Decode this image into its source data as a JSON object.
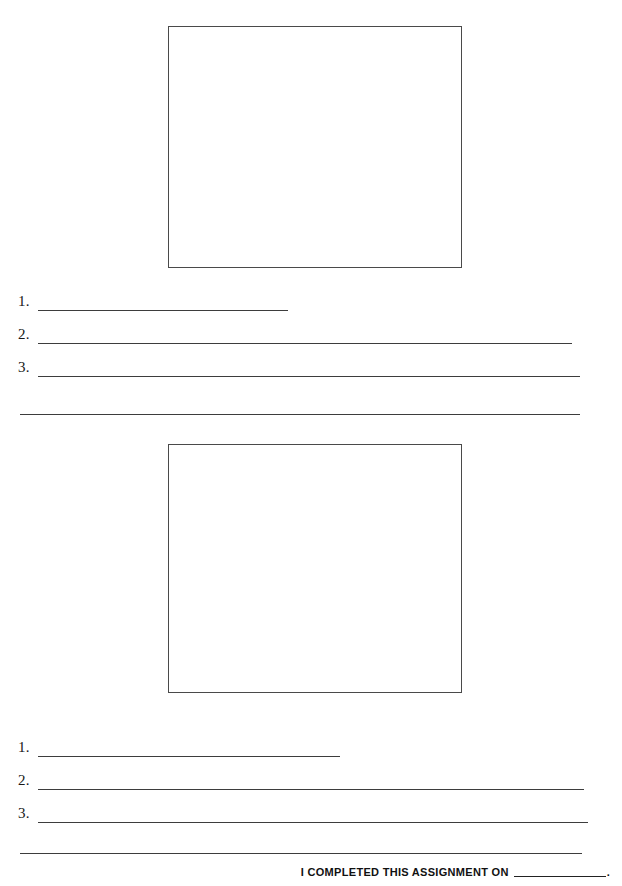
{
  "document": {
    "type": "worksheet",
    "background_color": "#ffffff",
    "ink_color": "#3d3d3d"
  },
  "sections": [
    {
      "id": "section-1",
      "draw_box": {
        "name": "drawing-area-1",
        "border_color": "#4a4a4a",
        "fill": "#ffffff"
      },
      "answer_lines": [
        {
          "number": "1.",
          "value": ""
        },
        {
          "number": "2.",
          "value": ""
        },
        {
          "number": "3.",
          "value": ""
        }
      ],
      "continuation_rule": {
        "value": ""
      }
    },
    {
      "id": "section-2",
      "draw_box": {
        "name": "drawing-area-2",
        "border_color": "#4a4a4a",
        "fill": "#ffffff"
      },
      "answer_lines": [
        {
          "number": "1.",
          "value": ""
        },
        {
          "number": "2.",
          "value": ""
        },
        {
          "number": "3.",
          "value": ""
        }
      ],
      "continuation_rule": {
        "value": ""
      }
    }
  ],
  "footer": {
    "label": "I COMPLETED THIS ASSIGNMENT ON",
    "blank_value": "",
    "period": "."
  }
}
